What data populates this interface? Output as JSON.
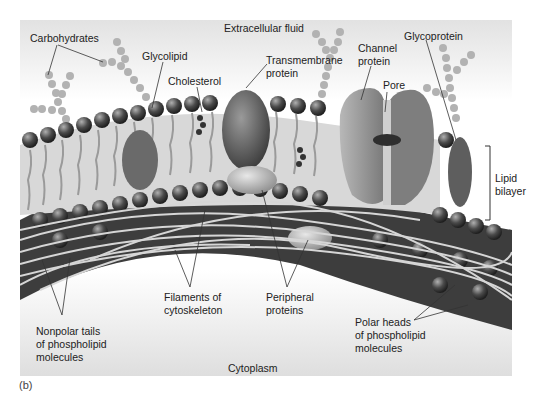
{
  "figure": {
    "panel_label": "(b)",
    "regions": {
      "top": "Extracellular fluid",
      "bottom": "Cytoplasm"
    },
    "labels": {
      "carbohydrates": "Carbohydrates",
      "glycolipid": "Glycolipid",
      "cholesterol": "Cholesterol",
      "transmembrane_protein": [
        "Transmembrane",
        "protein"
      ],
      "channel_protein": [
        "Channel",
        "protein"
      ],
      "pore": "Pore",
      "glycoprotein": "Glycoprotein",
      "lipid_bilayer": [
        "Lipid",
        "bilayer"
      ],
      "nonpolar_tails": [
        "Nonpolar tails",
        "of phospholipid",
        "molecules"
      ],
      "filaments": [
        "Filaments of",
        "cytoskeleton"
      ],
      "peripheral_proteins": [
        "Peripheral",
        "proteins"
      ],
      "polar_heads": [
        "Polar heads",
        "of phospholipid",
        "molecules"
      ]
    },
    "colors": {
      "panel_top": "#e2e2e2",
      "panel_bottom": "#dedede",
      "head_dark": "#3c3c3c",
      "head_light": "#9a9a9a",
      "tail": "#c8c8c8",
      "sugar": "#b0b0b0",
      "protein": "#8a8a8a",
      "channel": "#a8a8a8",
      "filament": "#d6d6d6",
      "leader_line": "#333333"
    }
  }
}
